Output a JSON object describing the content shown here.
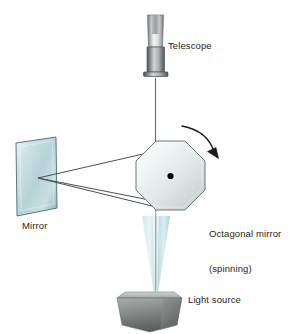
{
  "figure": {
    "background_color": "#ffffff",
    "width": 306,
    "height": 334
  },
  "labels": {
    "telescope": "Telescope",
    "mirror": "Mirror",
    "octagonal_mirror_line1": "Octagonal mirror",
    "octagonal_mirror_line2": "(spinning)",
    "light_source": "Light source"
  },
  "colors": {
    "text": "#231f20",
    "ray_line": "#4a5054",
    "mirror_glass_light": "#e8f2f3",
    "mirror_glass_mid": "#b8d4d8",
    "mirror_glass_dark": "#8fb4ba",
    "mirror_edge": "#4d6b70",
    "octagon_light": "#f4f7f7",
    "octagon_mid": "#dde5e5",
    "octagon_dark": "#c2cdcd",
    "octagon_edge": "#6d7878",
    "beam_light": "#dff0f2",
    "beam_mid": "#a8ced4",
    "box_light": "#b9bcbb",
    "box_mid": "#8d9190",
    "box_dark": "#5f6463",
    "telescope_light": "#f2f3f3",
    "telescope_mid": "#9fa3a4",
    "telescope_dark": "#5a5f60",
    "arrow": "#1a1a1a",
    "pivot_dot": "#000000"
  },
  "components": {
    "telescope": {
      "name": "telescope",
      "type": "cylindrical-tube",
      "upper_tube": "light tapered barrel",
      "lower_tube": "dark eyepiece collar",
      "flange": "base rim"
    },
    "octagonal_mirror": {
      "name": "octagonal-mirror",
      "type": "regular-octagon",
      "sides": 8,
      "center_marker": "pivot dot",
      "motion": "spinning",
      "rotation_direction": "clockwise"
    },
    "flat_mirror": {
      "name": "flat-mirror",
      "type": "tilted-plane-quadrilateral"
    },
    "light_source": {
      "name": "light-source",
      "type": "box-3d",
      "faces": 2
    },
    "light_beam": {
      "name": "light-beam",
      "type": "cone",
      "orientation": "apex-down"
    },
    "rays": {
      "name": "light-rays",
      "count": 2,
      "description": "two straight rays between flat mirror and octagonal mirror"
    },
    "rotation_arrow": {
      "name": "rotation-arrow",
      "type": "curved-arrow",
      "direction": "clockwise"
    },
    "sight_line": {
      "name": "sight-line",
      "description": "vertical line from telescope down to octagonal mirror"
    }
  }
}
